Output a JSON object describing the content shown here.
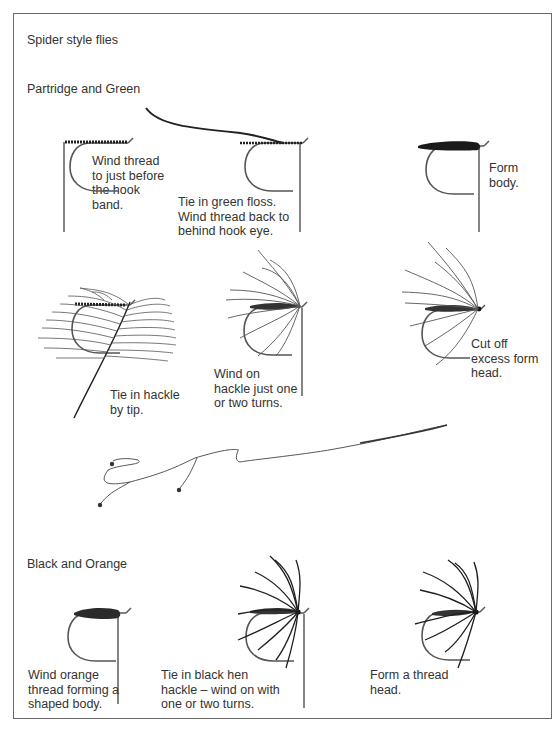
{
  "page": {
    "title": "Spider style flies",
    "border_color": "#6a6a6a",
    "ink_color": "#222222"
  },
  "sections": [
    {
      "heading": "Partridge and Green",
      "steps": [
        {
          "caption": "Wind thread\nto just before\nthe hook\nband.",
          "illustration": "hook-with-thread"
        },
        {
          "caption": "Tie in green floss.\nWind thread back to\nbehind hook eye.",
          "illustration": "hook-with-floss"
        },
        {
          "caption": "Form\nbody.",
          "illustration": "hook-with-body"
        },
        {
          "caption": "Tie in hackle\nby tip.",
          "illustration": "hook-with-hackle-feather"
        },
        {
          "caption": "Wind on\nhackle just one\nor two turns.",
          "illustration": "hook-with-wound-hackle"
        },
        {
          "caption": "Cut off\nexcess form\nhead.",
          "illustration": "finished-partridge-fly"
        }
      ]
    },
    {
      "illustration": "team-of-flies-on-leader"
    },
    {
      "heading": "Black and Orange",
      "steps": [
        {
          "caption": "Wind orange\nthread forming a\nshaped body.",
          "illustration": "hook-with-orange-body"
        },
        {
          "caption": "Tie in black hen\nhackle – wind on with\none or two turns.",
          "illustration": "hook-with-black-hackle"
        },
        {
          "caption": "Form a thread\nhead.",
          "illustration": "finished-black-orange-fly"
        }
      ]
    }
  ]
}
